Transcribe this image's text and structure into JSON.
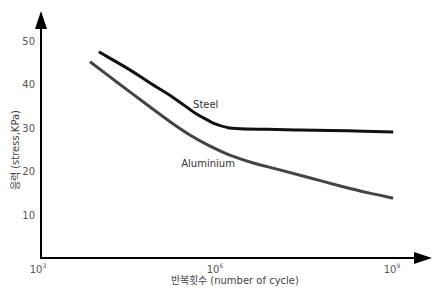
{
  "chart_data": {
    "type": "line",
    "title": "",
    "xlabel": "반복횟수 (number of cycle)",
    "ylabel": "응력 (stress,KPa)",
    "x_scale": "log10",
    "xlim_exponent": [
      3,
      9.4
    ],
    "ylim": [
      0,
      55
    ],
    "x_ticks": [
      {
        "base": "10",
        "exp": "3",
        "value_exponent": 3
      },
      {
        "base": "10",
        "exp": "6",
        "value_exponent": 6
      },
      {
        "base": "10",
        "exp": "9",
        "value_exponent": 9
      }
    ],
    "y_ticks": [
      {
        "label": "10",
        "value": 10
      },
      {
        "label": "20",
        "value": 20
      },
      {
        "label": "30",
        "value": 30
      },
      {
        "label": "40",
        "value": 40
      },
      {
        "label": "50",
        "value": 50
      }
    ],
    "grid": false,
    "legend": "inline-labels",
    "series": [
      {
        "name": "Steel",
        "color": "#111111",
        "x_exponent": [
          3.98,
          4.5,
          4.85,
          5.25,
          5.61,
          5.85,
          5.95,
          6.15,
          6.37,
          7.0,
          7.39,
          8.2,
          8.97
        ],
        "values": [
          47.5,
          43.4,
          40.3,
          36.9,
          33.4,
          31.6,
          30.9,
          30.1,
          29.8,
          29.6,
          29.5,
          29.3,
          29.0
        ]
      },
      {
        "name": "Aluminium",
        "color": "#444444",
        "x_exponent": [
          3.83,
          4.3,
          4.85,
          5.2,
          5.53,
          5.85,
          6.2,
          6.6,
          7.05,
          7.55,
          8.07,
          8.55,
          8.97
        ],
        "values": [
          45.2,
          40.4,
          34.8,
          31.3,
          28.3,
          25.9,
          23.7,
          21.9,
          20.3,
          18.5,
          16.6,
          15.0,
          13.8
        ]
      }
    ],
    "annotations": [
      {
        "text": "Steel",
        "near_series": "Steel",
        "x_exponent": 5.95,
        "value": 34.5
      },
      {
        "text": "Aluminium",
        "near_series": "Aluminium",
        "x_exponent": 5.75,
        "value": 21.0
      }
    ]
  }
}
